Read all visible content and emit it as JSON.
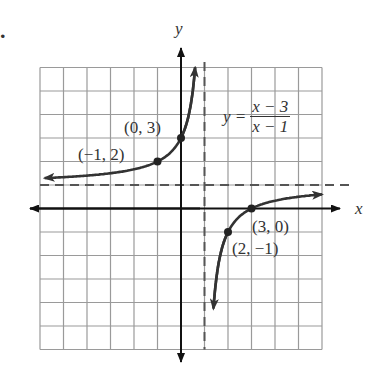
{
  "problem_marker": ".",
  "chart_data": {
    "type": "line",
    "title": "",
    "equation": {
      "lhs": "y =",
      "numerator": "x − 3",
      "denominator": "x − 1"
    },
    "xlabel": "x",
    "ylabel": "y",
    "xlim": [
      -6,
      6
    ],
    "ylim": [
      -6,
      6
    ],
    "grid": true,
    "grid_step": 1,
    "asymptotes": {
      "vertical": 1,
      "horizontal": 1
    },
    "series": [
      {
        "name": "left branch",
        "x": [
          -6,
          -4,
          -2,
          -1,
          0,
          0.5,
          0.6
        ],
        "y": [
          1.29,
          1.4,
          1.67,
          2,
          3,
          5,
          6
        ]
      },
      {
        "name": "right branch",
        "x": [
          1.4,
          1.5,
          2,
          3,
          4,
          6
        ],
        "y": [
          -4,
          -3,
          -1,
          0,
          0.33,
          0.6
        ]
      }
    ],
    "labeled_points": [
      {
        "label": "(−1, 2)",
        "x": -1,
        "y": 2
      },
      {
        "label": "(0, 3)",
        "x": 0,
        "y": 3
      },
      {
        "label": "(2, −1)",
        "x": 2,
        "y": -1
      },
      {
        "label": "(3, 0)",
        "x": 3,
        "y": 0
      }
    ]
  },
  "colors": {
    "grid": "#9a9a9a",
    "axis": "#111111",
    "curve": "#333333",
    "asymptote": "#555555"
  }
}
